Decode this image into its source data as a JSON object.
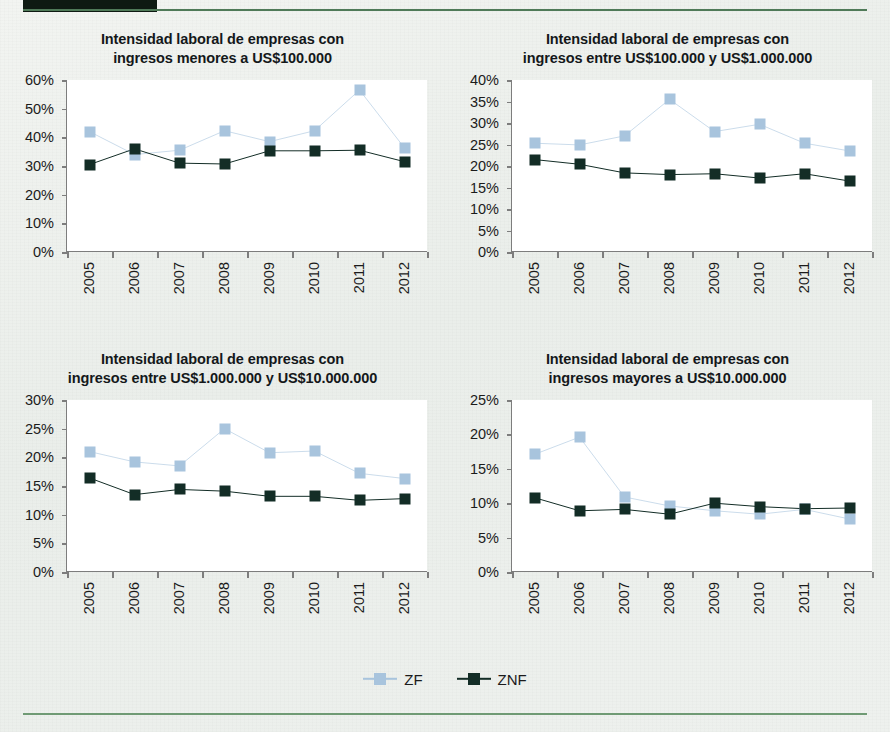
{
  "page": {
    "header_bar_color": "#0e1a12",
    "rule_color": "#4f7a58",
    "background_color": "#eef1ee"
  },
  "legend": {
    "position": "bottom-center",
    "items": [
      {
        "label": "ZF",
        "color": "#a8c4dd"
      },
      {
        "label": "ZNF",
        "color": "#132d26"
      }
    ]
  },
  "chart_data": [
    {
      "type": "line",
      "panel": "top-left",
      "title": "Intensidad laboral de empresas con ingresos menores a US$100.000",
      "title_line1": "Intensidad laboral de empresas con",
      "title_line2": "ingresos menores a US$100.000",
      "xlabel": "",
      "ylabel": "",
      "categories": [
        "2005",
        "2006",
        "2007",
        "2008",
        "2009",
        "2010",
        "2011",
        "2012"
      ],
      "yticks": [
        "0%",
        "10%",
        "20%",
        "30%",
        "40%",
        "50%",
        "60%"
      ],
      "ytick_values": [
        0,
        10,
        20,
        30,
        40,
        50,
        60
      ],
      "ylim": [
        0,
        60
      ],
      "grid": false,
      "series": [
        {
          "name": "ZF",
          "color": "#a8c4dd",
          "values": [
            42.0,
            34.0,
            35.5,
            42.3,
            38.5,
            42.3,
            56.5,
            36.3
          ]
        },
        {
          "name": "ZNF",
          "color": "#132d26",
          "values": [
            30.5,
            36.0,
            31.0,
            30.7,
            35.3,
            35.3,
            35.5,
            31.5
          ]
        }
      ]
    },
    {
      "type": "line",
      "panel": "top-right",
      "title": "Intensidad laboral de empresas con ingresos entre US$100.000 y US$1.000.000",
      "title_line1": "Intensidad laboral de empresas con",
      "title_line2": "ingresos entre US$100.000 y US$1.000.000",
      "xlabel": "",
      "ylabel": "",
      "categories": [
        "2005",
        "2006",
        "2007",
        "2008",
        "2009",
        "2010",
        "2011",
        "2012"
      ],
      "yticks": [
        "0%",
        "5%",
        "10%",
        "15%",
        "20%",
        "25%",
        "30%",
        "35%",
        "40%"
      ],
      "ytick_values": [
        0,
        5,
        10,
        15,
        20,
        25,
        30,
        35,
        40
      ],
      "ylim": [
        0,
        40
      ],
      "grid": false,
      "series": [
        {
          "name": "ZF",
          "color": "#a8c4dd",
          "values": [
            25.3,
            24.9,
            27.0,
            35.5,
            28.0,
            29.7,
            25.3,
            23.5
          ]
        },
        {
          "name": "ZNF",
          "color": "#132d26",
          "values": [
            21.5,
            20.4,
            18.4,
            18.0,
            18.2,
            17.2,
            18.2,
            16.5
          ]
        }
      ]
    },
    {
      "type": "line",
      "panel": "bottom-left",
      "title": "Intensidad laboral de empresas con ingresos entre US$1.000.000 y US$10.000.000",
      "title_line1": "Intensidad laboral de empresas con",
      "title_line2": "ingresos entre US$1.000.000 y US$10.000.000",
      "xlabel": "",
      "ylabel": "",
      "categories": [
        "2005",
        "2006",
        "2007",
        "2008",
        "2009",
        "2010",
        "2011",
        "2012"
      ],
      "yticks": [
        "0%",
        "5%",
        "10%",
        "15%",
        "20%",
        "25%",
        "30%"
      ],
      "ytick_values": [
        0,
        5,
        10,
        15,
        20,
        25,
        30
      ],
      "ylim": [
        0,
        30
      ],
      "grid": false,
      "series": [
        {
          "name": "ZF",
          "color": "#a8c4dd",
          "values": [
            21.0,
            19.2,
            18.5,
            25.0,
            20.8,
            21.1,
            17.2,
            16.3
          ]
        },
        {
          "name": "ZNF",
          "color": "#132d26",
          "values": [
            16.4,
            13.5,
            14.4,
            14.1,
            13.2,
            13.2,
            12.5,
            12.8
          ]
        }
      ]
    },
    {
      "type": "line",
      "panel": "bottom-right",
      "title": "Intensidad laboral de empresas con ingresos mayores a US$10.000.000",
      "title_line1": "Intensidad laboral de empresas con",
      "title_line2": "ingresos mayores a US$10.000.000",
      "xlabel": "",
      "ylabel": "",
      "categories": [
        "2005",
        "2006",
        "2007",
        "2008",
        "2009",
        "2010",
        "2011",
        "2012"
      ],
      "yticks": [
        "0%",
        "5%",
        "10%",
        "15%",
        "20%",
        "25%"
      ],
      "ytick_values": [
        0,
        5,
        10,
        15,
        20,
        25
      ],
      "ylim": [
        0,
        25
      ],
      "grid": false,
      "series": [
        {
          "name": "ZF",
          "color": "#a8c4dd",
          "values": [
            17.1,
            19.6,
            10.9,
            9.6,
            8.9,
            8.4,
            9.1,
            7.7
          ]
        },
        {
          "name": "ZNF",
          "color": "#132d26",
          "values": [
            10.8,
            8.9,
            9.1,
            8.4,
            10.0,
            9.5,
            9.2,
            9.3
          ]
        }
      ]
    }
  ]
}
